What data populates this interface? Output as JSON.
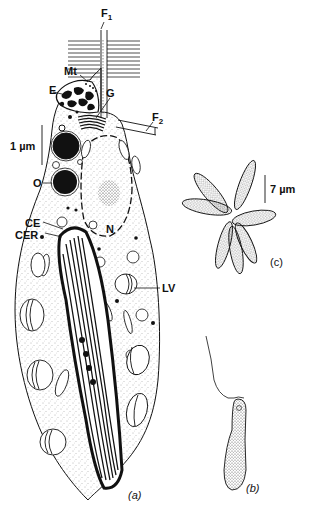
{
  "figure": {
    "panels": {
      "a": "(a)",
      "b": "(b)",
      "c": "(c)"
    },
    "labels": {
      "F1": {
        "main": "F",
        "sub": "1"
      },
      "F2": {
        "main": "F",
        "sub": "2"
      },
      "Mt": "Mt",
      "E": "E",
      "G": "G",
      "O": "O",
      "N": "N",
      "CE": "CE",
      "CER": "CER",
      "LV": "LV"
    },
    "scale_bars": {
      "a": "1 µm",
      "c": "7 µm"
    },
    "colors": {
      "ink": "#111111",
      "stipple": "#555555",
      "background": "#ffffff"
    }
  }
}
